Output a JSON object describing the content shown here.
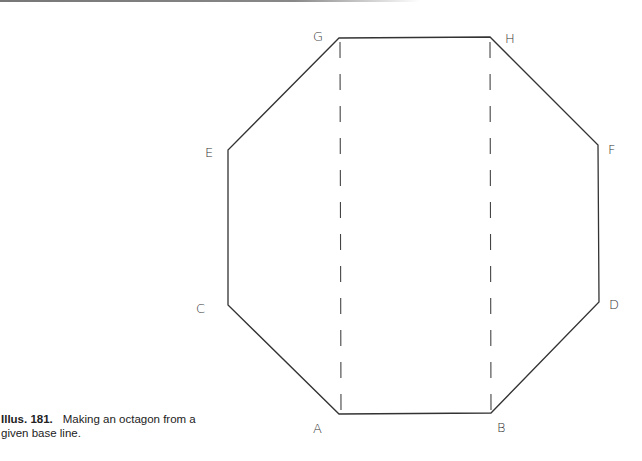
{
  "diagram": {
    "vertices": [
      {
        "id": "A",
        "x": 339,
        "y": 414
      },
      {
        "id": "B",
        "x": 491,
        "y": 413
      },
      {
        "id": "D",
        "x": 599,
        "y": 302
      },
      {
        "id": "F",
        "x": 598,
        "y": 145
      },
      {
        "id": "H",
        "x": 490,
        "y": 37
      },
      {
        "id": "G",
        "x": 339,
        "y": 38
      },
      {
        "id": "E",
        "x": 228,
        "y": 150
      },
      {
        "id": "C",
        "x": 228,
        "y": 305
      }
    ],
    "labels": {
      "A": "A",
      "B": "B",
      "C": "C",
      "D": "D",
      "E": "E",
      "F": "F",
      "G": "G",
      "H": "H"
    },
    "dashed_lines": [
      {
        "from": "G",
        "to": "A"
      },
      {
        "from": "H",
        "to": "B"
      }
    ]
  },
  "caption": {
    "number": "Illus. 181.",
    "text": "Making an octagon from a given base line."
  }
}
